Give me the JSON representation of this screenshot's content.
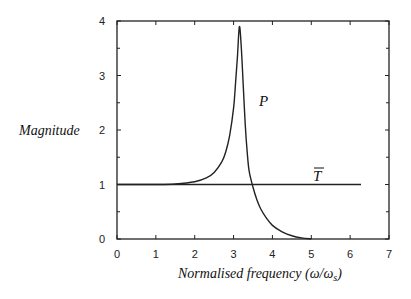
{
  "chart_data": {
    "type": "line",
    "title": "",
    "xlabel": "Normalised frequency (ω/ωs)",
    "ylabel": "Magnitude",
    "xlim": [
      0,
      7
    ],
    "ylim": [
      0,
      4
    ],
    "x_ticks": [
      "0",
      "1",
      "2",
      "3",
      "4",
      "5",
      "6",
      "7"
    ],
    "y_ticks": [
      "0",
      "1",
      "2",
      "3",
      "4"
    ],
    "grid": false,
    "legend": "none (curves labelled inline)",
    "series": [
      {
        "name": "P",
        "x": [
          0,
          0.5,
          1.0,
          1.5,
          2.0,
          2.3,
          2.5,
          2.7,
          2.8,
          2.9,
          3.0,
          3.05,
          3.1,
          3.15,
          3.2,
          3.25,
          3.3,
          3.35,
          3.4,
          3.5,
          3.6,
          3.7,
          3.85,
          4.0,
          4.25,
          4.5,
          4.75,
          5.0
        ],
        "values": [
          1.0,
          1.0,
          1.0,
          1.01,
          1.05,
          1.12,
          1.22,
          1.42,
          1.6,
          1.9,
          2.4,
          2.85,
          3.35,
          3.9,
          3.5,
          2.8,
          2.1,
          1.6,
          1.25,
          0.95,
          0.72,
          0.55,
          0.38,
          0.25,
          0.13,
          0.06,
          0.02,
          0.0
        ]
      },
      {
        "name": "T̄",
        "x": [
          0,
          6.28
        ],
        "values": [
          1.0,
          1.0
        ]
      }
    ],
    "annotations": [
      {
        "text": "P",
        "x": 3.7,
        "y": 2.1
      },
      {
        "text": "T̄",
        "x": 5.8,
        "y": 1.2
      }
    ]
  },
  "labels": {
    "ylabel": "Magnitude",
    "xlabel_main": "Normalised frequency (ω/ω",
    "xlabel_sub": "s",
    "xlabel_end": ")",
    "curve_p": "P",
    "curve_t": "T"
  }
}
